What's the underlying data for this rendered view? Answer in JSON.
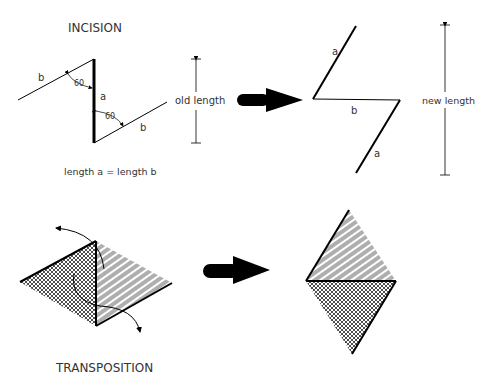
{
  "incision": {
    "title": "INCISION",
    "label_a": "a",
    "label_b_upper": "b",
    "label_b_lower": "b",
    "angle_upper": "60",
    "angle_lower": "60",
    "old_length": "old length",
    "equation": "length a = length b"
  },
  "incision_result": {
    "label_a_upper": "a",
    "label_b": "b",
    "label_a_lower": "a",
    "new_length": "new length"
  },
  "transposition": {
    "title": "TRANSPOSITION"
  },
  "colors": {
    "line": "#000000",
    "text": "#333333",
    "background": "#ffffff"
  }
}
